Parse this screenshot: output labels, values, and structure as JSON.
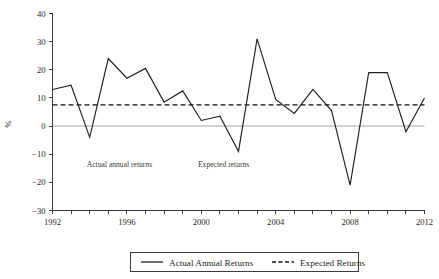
{
  "chart_data": {
    "type": "line",
    "title": "",
    "subtitle": "",
    "xlabel": "",
    "ylabel": "%",
    "x": [
      1992,
      1993,
      1994,
      1995,
      1996,
      1997,
      1998,
      1999,
      2000,
      2001,
      2002,
      2003,
      2004,
      2005,
      2006,
      2007,
      2008,
      2009,
      2010,
      2011,
      2012
    ],
    "categories": [
      "1992",
      "1993",
      "1994",
      "1995",
      "1996",
      "1997",
      "1998",
      "1999",
      "2000",
      "2001",
      "2002",
      "2003",
      "2004",
      "2005",
      "2006",
      "2007",
      "2008",
      "2009",
      "2010",
      "2011",
      "2012"
    ],
    "series": [
      {
        "name": "Actual Annual Returns",
        "style": "solid",
        "color": "#202020",
        "values": [
          13,
          14.5,
          -4,
          24,
          17,
          20.5,
          8.5,
          12.5,
          2,
          3.5,
          -9,
          31,
          9.5,
          4.5,
          13,
          5.5,
          -21,
          19,
          19,
          -2,
          10
        ]
      },
      {
        "name": "Expected Returns",
        "style": "dashed",
        "color": "#101010",
        "constant_value": 7.5,
        "values": [
          7.5,
          7.5,
          7.5,
          7.5,
          7.5,
          7.5,
          7.5,
          7.5,
          7.5,
          7.5,
          7.5,
          7.5,
          7.5,
          7.5,
          7.5,
          7.5,
          7.5,
          7.5,
          7.5,
          7.5,
          7.5
        ]
      }
    ],
    "xlim": [
      1992,
      2012
    ],
    "ylim": [
      -30,
      40
    ],
    "yticks": [
      -30,
      -20,
      -10,
      0,
      10,
      20,
      30,
      40
    ],
    "ytick_labels": [
      "−30",
      "−20",
      "−10",
      "0",
      "10",
      "20",
      "30",
      "40"
    ],
    "xticks": [
      1992,
      1993,
      1994,
      1995,
      1996,
      1997,
      1998,
      1999,
      2000,
      2001,
      2002,
      2003,
      2004,
      2005,
      2006,
      2007,
      2008,
      2009,
      2010,
      2011,
      2012
    ],
    "xtick_labels_shown": [
      "1992",
      "1996",
      "2000",
      "2004",
      "2008",
      "2012"
    ],
    "xtick_labels_shown_values": [
      1992,
      1996,
      2000,
      2004,
      2008,
      2012
    ],
    "grid": false,
    "zero_reference_line": 0,
    "legend_position": "bottom-center",
    "annotations": [
      {
        "text": "Actual annual returns",
        "x": 1995.6,
        "y": -14.5
      },
      {
        "text": "Expected returns",
        "x": 2001.2,
        "y": -14.5
      }
    ]
  },
  "legend": {
    "entries": [
      {
        "label": "Actual Annual Returns",
        "style": "solid"
      },
      {
        "label": "Expected Returns",
        "style": "dashed"
      }
    ]
  },
  "colors": {
    "actual": "#202020",
    "expected": "#101010",
    "axis": "#3c3c3c",
    "zero_line": "#d2d2d2",
    "background": "#ffffff"
  }
}
